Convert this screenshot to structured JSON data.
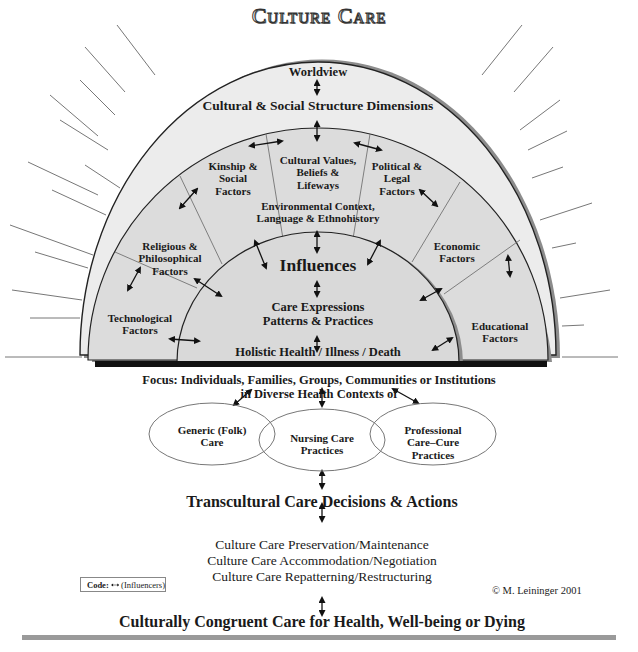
{
  "title": "Culture Care",
  "outer_band": {
    "worldview": "Worldview",
    "structure": "Cultural & Social Structure Dimensions"
  },
  "factors": {
    "technological": "Technological\nFactors",
    "religious": "Religious &\nPhilosophical\nFactors",
    "kinship": "Kinship &\nSocial\nFactors",
    "cultural_values": "Cultural Values,\nBeliefs &\nLifeways",
    "political": "Political &\nLegal\nFactors",
    "economic": "Economic\nFactors",
    "educational": "Educational\nFactors",
    "environmental": "Environmental Context,\nLanguage & Ethnohistory"
  },
  "inner": {
    "influences": "Influences",
    "care_expressions": "Care Expressions\nPatterns & Practices",
    "holistic": "Holistic Health / Illness / Death"
  },
  "focus": {
    "line1": "Focus:  Individuals, Families, Groups, Communities or Institutions",
    "line2": "in Diverse Health Contexts of"
  },
  "care_systems": [
    {
      "label": "Generic (Folk)\nCare"
    },
    {
      "label": "Nursing Care\nPractices"
    },
    {
      "label": "Professional\nCare–Cure\nPractices"
    }
  ],
  "decisions": "Transcultural Care Decisions & Actions",
  "modes": [
    "Culture Care Preservation/Maintenance",
    "Culture Care Accommodation/Negotiation",
    "Culture Care Repatterning/Restructuring"
  ],
  "outcome": "Culturally Congruent Care for Health, Well-being or Dying",
  "legend": {
    "code_label": "Code:",
    "meaning": "(Influencers)"
  },
  "copyright": "© M. Leininger 2001",
  "colors": {
    "outer_fill": "#ececec",
    "middle_fill": "#dcdcdc",
    "inner_fill": "#d9d9d9",
    "shadow": "#8c8c8c",
    "line": "#222222",
    "bottom_bar": "#9a9a9a"
  }
}
